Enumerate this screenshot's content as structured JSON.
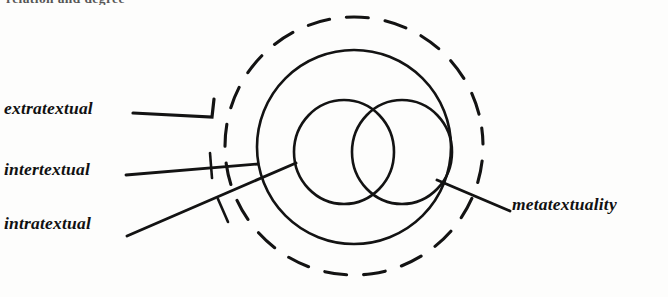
{
  "figure": {
    "kind": "nested-circles-diagram",
    "ink_color": "#111111",
    "background_color": "#fdfdfc",
    "cropped_text_above": "relation and degree",
    "labels": [
      {
        "id": "extratextual",
        "text": "extratextual",
        "position": "left-upper",
        "points_to": "dashed-outer-circle"
      },
      {
        "id": "intertextual",
        "text": "intertextual",
        "position": "left-middle",
        "points_to": "solid-main-circle"
      },
      {
        "id": "intratextual",
        "text": "intratextual",
        "position": "left-lower",
        "points_to": "inner-circles"
      },
      {
        "id": "metatextuality",
        "text": "metatextuality",
        "position": "right",
        "points_to": "solid-main-circle"
      }
    ],
    "shapes": [
      {
        "id": "dashed-outer-circle",
        "type": "circle",
        "stroke": "dashed",
        "cx": 354,
        "cy": 146,
        "r": 129
      },
      {
        "id": "solid-main-circle",
        "type": "circle",
        "stroke": "solid",
        "cx": 354,
        "cy": 147,
        "r": 97
      },
      {
        "id": "inner-circle-left",
        "type": "circle",
        "stroke": "solid",
        "cx": 344,
        "cy": 152,
        "r": 51
      },
      {
        "id": "inner-circle-right",
        "type": "circle",
        "stroke": "solid",
        "cx": 402,
        "cy": 152,
        "r": 51
      }
    ]
  }
}
